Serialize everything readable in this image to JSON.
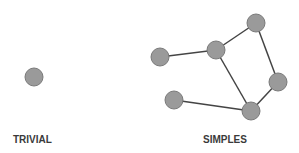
{
  "colors": {
    "node_fill": "#9a9a9a",
    "node_stroke": "#7a7a7a",
    "edge": "#444444",
    "label": "#3a3a3a"
  },
  "graphs": [
    {
      "label": "TRIVIAL",
      "label_pos": [
        13,
        143
      ],
      "nodes": [
        {
          "id": "t1",
          "x": 34,
          "y": 77
        }
      ],
      "edges": []
    },
    {
      "label": "SIMPLES",
      "label_pos": [
        203,
        143
      ],
      "nodes": [
        {
          "id": "a",
          "x": 160,
          "y": 57
        },
        {
          "id": "b",
          "x": 216,
          "y": 50
        },
        {
          "id": "c",
          "x": 256,
          "y": 23
        },
        {
          "id": "d",
          "x": 278,
          "y": 82
        },
        {
          "id": "e",
          "x": 251,
          "y": 111
        },
        {
          "id": "f",
          "x": 174,
          "y": 100
        }
      ],
      "edges": [
        [
          "a",
          "b"
        ],
        [
          "b",
          "c"
        ],
        [
          "c",
          "d"
        ],
        [
          "d",
          "e"
        ],
        [
          "b",
          "e"
        ],
        [
          "f",
          "e"
        ]
      ]
    }
  ],
  "node_radius": 9
}
